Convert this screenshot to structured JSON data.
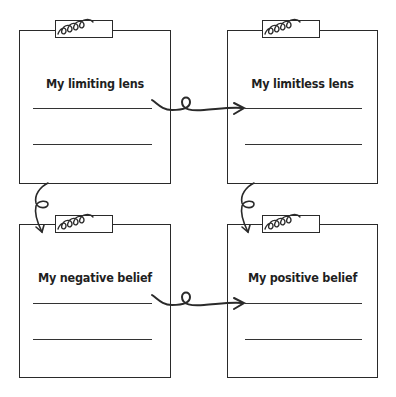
{
  "diagram": {
    "cards": [
      {
        "id": "top-left",
        "title": "My limiting lens",
        "lines": 2
      },
      {
        "id": "top-right",
        "title": "My limitless lens",
        "lines": 2
      },
      {
        "id": "bottom-left",
        "title": "My negative belief",
        "lines": 2
      },
      {
        "id": "bottom-right",
        "title": "My positive belief",
        "lines": 2
      }
    ],
    "connectors": [
      {
        "from": "top-left",
        "to": "top-right",
        "type": "curly-arrow"
      },
      {
        "from": "top-left",
        "to": "bottom-left",
        "type": "curly-arrow"
      },
      {
        "from": "top-right",
        "to": "bottom-right",
        "type": "curly-arrow"
      },
      {
        "from": "bottom-left",
        "to": "bottom-right",
        "type": "curly-arrow"
      }
    ],
    "colors": {
      "ink": "#2a2a2a",
      "background": "#ffffff"
    }
  }
}
